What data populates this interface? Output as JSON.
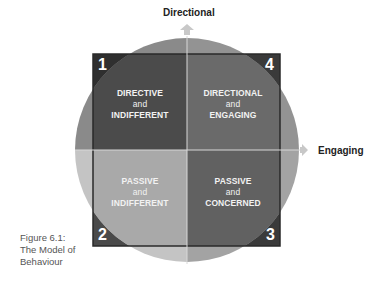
{
  "figure": {
    "axes": {
      "vertical_label": "Directional",
      "horizontal_label": "Engaging"
    },
    "quadrants": [
      {
        "number": "1",
        "line1": "DIRECTIVE",
        "line2": "and",
        "line3": "INDIFFERENT",
        "position": "top-left"
      },
      {
        "number": "4",
        "line1": "DIRECTIONAL",
        "line2": "and",
        "line3": "ENGAGING",
        "position": "top-right"
      },
      {
        "number": "2",
        "line1": "PASSIVE",
        "line2": "and",
        "line3": "INDIFFERENT",
        "position": "bottom-left"
      },
      {
        "number": "3",
        "line1": "PASSIVE",
        "line2": "and",
        "line3": "CONCERNED",
        "position": "bottom-right"
      }
    ],
    "caption": {
      "line1": "Figure 6.1:",
      "line2": "The Model of",
      "line3": "Behaviour"
    },
    "colors": {
      "q1_square": "#3f3f3f",
      "q4_square": "#5e5e5e",
      "q2_square": "#a6a6a6",
      "q3_square": "#555555",
      "circle_top_left": "#6e6e6e",
      "circle_top_right": "#7c7c7c",
      "circle_bottom_left": "#b9b9b9",
      "circle_bottom_right": "#8a8a8a",
      "corner_dark": "#2e2e2e",
      "arrow": "#c8c8c8"
    }
  }
}
